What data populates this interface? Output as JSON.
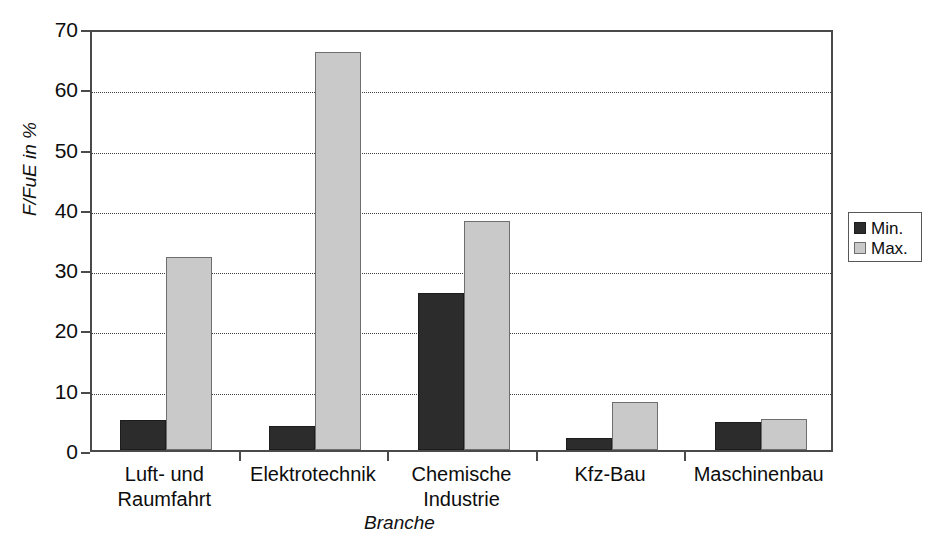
{
  "chart_data": {
    "type": "bar",
    "title": "",
    "subtitle": "",
    "xlabel": "Branche",
    "ylabel": "F/FuE in %",
    "ylim": [
      0,
      70
    ],
    "ytick_values": [
      0,
      10,
      20,
      30,
      40,
      50,
      60,
      70
    ],
    "ytick_labels": [
      "0",
      "10",
      "20",
      "30",
      "40",
      "50",
      "60",
      "70"
    ],
    "grid": "horizontal-dotted",
    "legend_position": "right",
    "categories": [
      "Luft- und\nRaumfahrt",
      "Elektrotechnik",
      "Chemische\nIndustrie",
      "Kfz-Bau",
      "Maschinenbau"
    ],
    "series": [
      {
        "name": "Min.",
        "color": "#2c2c2c",
        "values": [
          5.0,
          4.0,
          26.0,
          2.0,
          4.7
        ]
      },
      {
        "name": "Max.",
        "color": "#c9c9c9",
        "values": [
          32.0,
          66.0,
          38.0,
          8.0,
          5.2
        ]
      }
    ]
  },
  "legend": {
    "entries": [
      {
        "label": "Min."
      },
      {
        "label": "Max."
      }
    ]
  },
  "axes": {
    "y_title": "F/FuE in %",
    "x_title": "Branche"
  },
  "colors": {
    "min_series": "#2c2c2c",
    "max_series": "#c9c9c9",
    "axis": "#4a4a4a",
    "grid": "#3d3d3d",
    "background": "#ffffff"
  }
}
